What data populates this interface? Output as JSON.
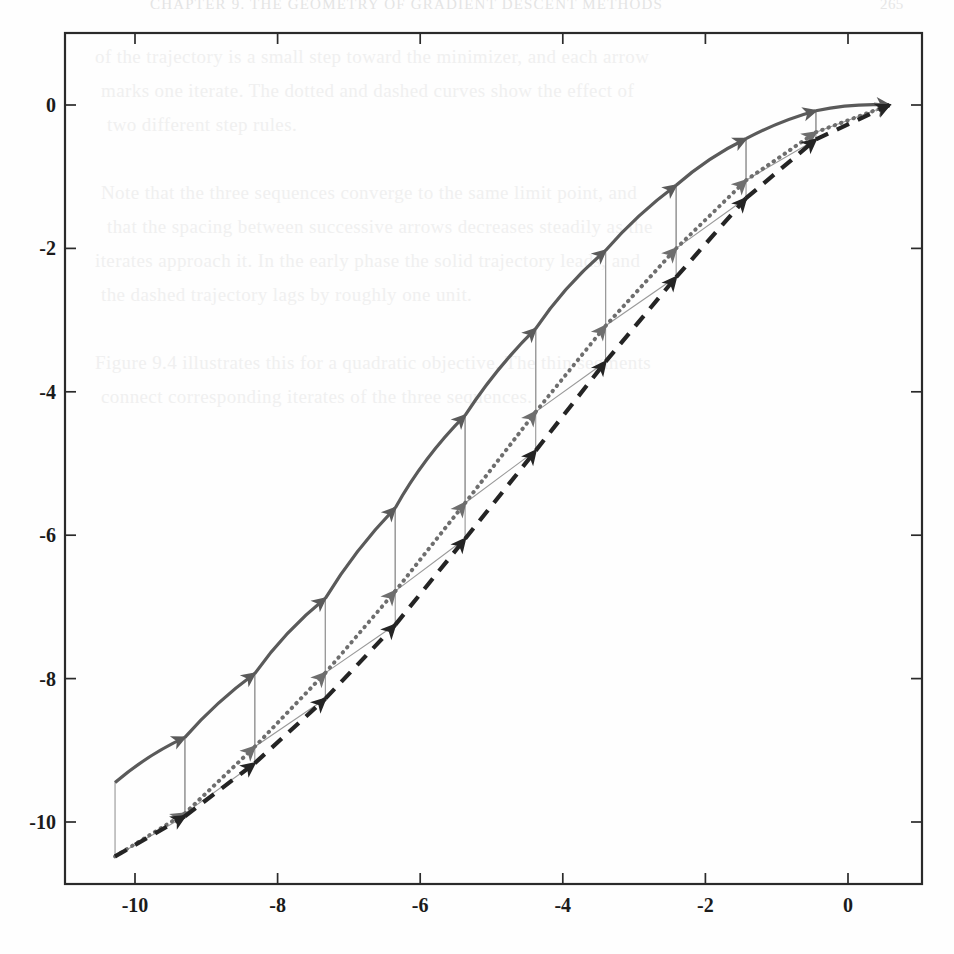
{
  "page": {
    "kind": "scanned-book-figure",
    "background_color": "#fefefe",
    "show_through_header": "CHAPTER 9. THE GEOMETRY OF GRADIENT DESCENT METHODS",
    "show_through_page_number": "265",
    "show_through_lines": [
      "of the trajectory is a small step toward the minimizer, and each arrow",
      "marks one iterate. The dotted and dashed curves show the effect of",
      "two different step rules.",
      "",
      "Note that the three sequences converge to the same limit point, and",
      "that the spacing between successive arrows decreases steadily as the",
      "iterates approach it. In the early phase the solid trajectory leads, and",
      "the dashed trajectory lags by roughly one unit.",
      "",
      "Figure 9.4 illustrates this for a quadratic objective. The thin segments",
      "connect corresponding iterates of the three sequences."
    ]
  },
  "chart_data": {
    "type": "line",
    "title": "",
    "subtitle": "",
    "xlabel": "",
    "ylabel": "",
    "xlim": [
      -10.9,
      1.02
    ],
    "ylim": [
      -11.45,
      0.45
    ],
    "xticks": [
      -10,
      -8,
      -6,
      -4,
      -2,
      0
    ],
    "xtick_labels": [
      "-10",
      "-8",
      "-6",
      "-4",
      "-2",
      "0"
    ],
    "yticks": [
      0,
      -2,
      -4,
      -6,
      -8,
      -10
    ],
    "ytick_labels": [
      "0",
      "-2",
      "-4",
      "-6",
      "-8",
      "-10"
    ],
    "grid": false,
    "legend": "none",
    "box": true,
    "tick_direction": "in",
    "axis_color": "#2a2a2a",
    "connector_color": "#9a9a9a",
    "series": [
      {
        "name": "solid-trajectory",
        "style": "solid",
        "color": "#5a5a5a",
        "line_width": 3.2,
        "marker": "arrow",
        "marker_color": "#5a5a5a",
        "points": [
          [
            -10.28,
            -9.45
          ],
          [
            -9.3,
            -8.82
          ],
          [
            -8.32,
            -7.93
          ],
          [
            -7.33,
            -6.88
          ],
          [
            -6.35,
            -5.62
          ],
          [
            -5.37,
            -4.33
          ],
          [
            -4.38,
            -3.12
          ],
          [
            -3.4,
            -2.03
          ],
          [
            -2.41,
            -1.12
          ],
          [
            -1.43,
            -0.47
          ],
          [
            -0.45,
            -0.08
          ],
          [
            0.58,
            0.0
          ]
        ]
      },
      {
        "name": "dotted-trajectory",
        "style": "dotted",
        "color": "#6e6e6e",
        "line_width": 4.0,
        "marker": "arrow",
        "marker_color": "#6e6e6e",
        "points": [
          [
            -10.28,
            -10.48
          ],
          [
            -9.3,
            -9.88
          ],
          [
            -8.32,
            -8.95
          ],
          [
            -7.33,
            -7.92
          ],
          [
            -6.35,
            -6.78
          ],
          [
            -5.37,
            -5.55
          ],
          [
            -4.38,
            -4.28
          ],
          [
            -3.4,
            -3.08
          ],
          [
            -2.41,
            -2.0
          ],
          [
            -1.43,
            -1.05
          ],
          [
            -0.45,
            -0.38
          ],
          [
            0.58,
            0.0
          ]
        ]
      },
      {
        "name": "dashed-trajectory",
        "style": "dashed",
        "color": "#242424",
        "line_width": 4.2,
        "marker": "arrow",
        "marker_color": "#242424",
        "points": [
          [
            -10.28,
            -10.48
          ],
          [
            -9.3,
            -9.92
          ],
          [
            -8.32,
            -9.18
          ],
          [
            -7.33,
            -8.28
          ],
          [
            -6.35,
            -7.25
          ],
          [
            -5.37,
            -6.05
          ],
          [
            -4.38,
            -4.82
          ],
          [
            -3.4,
            -3.58
          ],
          [
            -2.41,
            -2.4
          ],
          [
            -1.43,
            -1.3
          ],
          [
            -0.45,
            -0.48
          ],
          [
            0.58,
            0.0
          ]
        ]
      }
    ],
    "connectors": [
      {
        "name": "vertical",
        "from_series": "solid-trajectory",
        "to_series": "dotted-trajectory"
      },
      {
        "name": "diagonal",
        "from_series": "dotted-trajectory",
        "to_series": "dashed-trajectory"
      },
      {
        "name": "closing",
        "from_series": "dashed-trajectory",
        "to_series": "solid-trajectory"
      }
    ]
  }
}
